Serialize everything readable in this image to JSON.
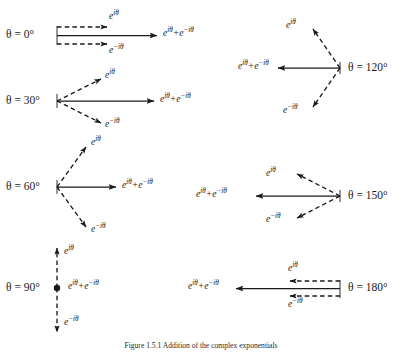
{
  "figure": {
    "caption": "Figure 1.5.1  Addition of the complex exponentials",
    "background_color": "#ffffff",
    "stroke_color": "#1a1a1a",
    "symbols": {
      "e_plus": "e",
      "e_plus_exp": "iθ",
      "e_minus": "e",
      "e_minus_exp": "−iθ",
      "sum_prefix": "e",
      "sum_mid": "+e",
      "plus": "+"
    },
    "panels": [
      {
        "id": "theta-0",
        "angle_label": "θ = 0°",
        "angle_value": 0,
        "column": "left",
        "vertex": {
          "x": 57,
          "y": 35
        },
        "label_pos": {
          "x": 6,
          "y": 29
        },
        "resultant": {
          "label_e_plus": "e",
          "label_e_plus_exp": "iθ",
          "label_e_minus": "e",
          "label_e_minus_exp": "−iθ",
          "label_pos": {
            "x": 163,
            "y": 29
          },
          "tip": {
            "x": 157,
            "y": 35
          }
        },
        "components": [
          {
            "name": "e^{iθ}",
            "tip": {
              "x": 107,
              "y": 27
            },
            "label_pos": {
              "x": 109,
              "y": 12
            },
            "style": "dashed"
          },
          {
            "name": "e^{-iθ}",
            "tip": {
              "x": 107,
              "y": 44
            },
            "label_pos": {
              "x": 109,
              "y": 48
            },
            "style": "dashed"
          }
        ]
      },
      {
        "id": "theta-30",
        "angle_label": "θ = 30°",
        "angle_value": 30,
        "column": "left",
        "vertex": {
          "x": 57,
          "y": 101
        },
        "label_pos": {
          "x": 6,
          "y": 95
        },
        "resultant": {
          "label_pos": {
            "x": 160,
            "y": 95
          },
          "tip": {
            "x": 154,
            "y": 101
          }
        },
        "components": [
          {
            "name": "e^{iθ}",
            "tip": {
              "x": 101,
              "y": 79
            },
            "label_pos": {
              "x": 105,
              "y": 72
            },
            "style": "dashed"
          },
          {
            "name": "e^{-iθ}",
            "tip": {
              "x": 101,
              "y": 123
            },
            "label_pos": {
              "x": 105,
              "y": 122
            },
            "style": "dashed"
          }
        ]
      },
      {
        "id": "theta-60",
        "angle_label": "θ = 60°",
        "angle_value": 60,
        "column": "left",
        "vertex": {
          "x": 57,
          "y": 187
        },
        "label_pos": {
          "x": 6,
          "y": 181
        },
        "resultant": {
          "label_pos": {
            "x": 122,
            "y": 181
          },
          "tip": {
            "x": 116,
            "y": 187
          }
        },
        "components": [
          {
            "name": "e^{iθ}",
            "tip": {
              "x": 86,
              "y": 146
            },
            "label_pos": {
              "x": 91,
              "y": 139
            },
            "style": "dashed"
          },
          {
            "name": "e^{-iθ}",
            "tip": {
              "x": 86,
              "y": 228
            },
            "label_pos": {
              "x": 91,
              "y": 226
            },
            "style": "dashed"
          }
        ]
      },
      {
        "id": "theta-90",
        "angle_label": "θ = 90°",
        "angle_value": 90,
        "column": "left",
        "vertex": {
          "x": 57,
          "y": 288
        },
        "label_pos": {
          "x": 6,
          "y": 282
        },
        "resultant": {
          "label_pos": {
            "x": 68,
            "y": 282
          },
          "tip": {
            "x": 57,
            "y": 288
          },
          "is_point": true
        },
        "components": [
          {
            "name": "e^{iθ}",
            "tip": {
              "x": 57,
              "y": 247
            },
            "label_pos": {
              "x": 63,
              "y": 248
            },
            "style": "dashed"
          },
          {
            "name": "e^{-iθ}",
            "tip": {
              "x": 57,
              "y": 333
            },
            "label_pos": {
              "x": 63,
              "y": 322
            },
            "style": "dashed"
          }
        ]
      },
      {
        "id": "theta-120",
        "angle_label": "θ = 120°",
        "angle_value": 120,
        "column": "right",
        "vertex": {
          "x": 340,
          "y": 68
        },
        "label_pos": {
          "x": 348,
          "y": 62
        },
        "resultant": {
          "label_pos": {
            "x": 240,
            "y": 62
          },
          "tip": {
            "x": 278,
            "y": 68
          }
        },
        "components": [
          {
            "name": "e^{iθ}",
            "tip": {
              "x": 312,
              "y": 28
            },
            "label_pos": {
              "x": 287,
              "y": 22
            },
            "style": "dashed"
          },
          {
            "name": "e^{-iθ}",
            "tip": {
              "x": 312,
              "y": 108
            },
            "label_pos": {
              "x": 285,
              "y": 108
            },
            "style": "dashed"
          }
        ]
      },
      {
        "id": "theta-150",
        "angle_label": "θ = 150°",
        "angle_value": 150,
        "column": "right",
        "vertex": {
          "x": 340,
          "y": 196
        },
        "label_pos": {
          "x": 348,
          "y": 190
        },
        "resultant": {
          "label_pos": {
            "x": 196,
            "y": 190
          },
          "tip": {
            "x": 256,
            "y": 196
          }
        },
        "components": [
          {
            "name": "e^{iθ}",
            "tip": {
              "x": 296,
              "y": 173
            },
            "label_pos": {
              "x": 268,
              "y": 170
            },
            "style": "dashed"
          },
          {
            "name": "e^{-iθ}",
            "tip": {
              "x": 296,
              "y": 219
            },
            "label_pos": {
              "x": 268,
              "y": 218
            },
            "style": "dashed"
          }
        ]
      },
      {
        "id": "theta-180",
        "angle_label": "θ = 180°",
        "angle_value": 180,
        "column": "right",
        "vertex": {
          "x": 340,
          "y": 288
        },
        "label_pos": {
          "x": 348,
          "y": 282
        },
        "resultant": {
          "label_pos": {
            "x": 190,
            "y": 282
          },
          "tip": {
            "x": 236,
            "y": 288
          }
        },
        "components": [
          {
            "name": "e^{iθ}",
            "tip": {
              "x": 290,
              "y": 281
            },
            "label_pos": {
              "x": 289,
              "y": 265
            },
            "style": "dashed"
          },
          {
            "name": "e^{-iθ}",
            "tip": {
              "x": 290,
              "y": 296
            },
            "label_pos": {
              "x": 289,
              "y": 301
            },
            "style": "dashed"
          }
        ]
      }
    ]
  }
}
